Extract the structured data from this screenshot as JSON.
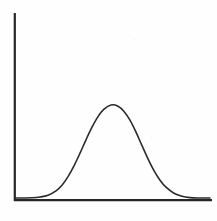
{
  "figure": {
    "title": "",
    "background_color": "#fefefe",
    "width": 217,
    "height": 221
  },
  "axes": {
    "line_color": "#262626",
    "x_axis": {
      "name": "horizontal-axis",
      "label": "",
      "x_start": 14,
      "x_end": 212,
      "y": 200,
      "thickness": 2
    },
    "y_axis": {
      "name": "vertical-axis",
      "label": "",
      "x": 14.5,
      "y_start": 13,
      "y_end": 201,
      "thickness": 2
    },
    "ticks": [],
    "tick_labels": [],
    "grid": false
  },
  "chart_data": {
    "type": "line",
    "title": "",
    "subtitle": "",
    "xlabel": "",
    "ylabel": "",
    "xlim": [
      0,
      217
    ],
    "ylim": [
      0,
      221
    ],
    "grid": false,
    "legend": [],
    "annotations": [],
    "curve": {
      "name": "bell-curve",
      "distribution": "gaussian",
      "stroke_color": "#2b2b2b",
      "stroke_width": 1.6,
      "baseline_y": 198,
      "peak_x": 111,
      "peak_y": 105,
      "amplitude": 93,
      "sigma": 25.5,
      "x_domain": [
        16,
        210
      ],
      "x": [
        16,
        24,
        32,
        40,
        48,
        56,
        62,
        68,
        74,
        80,
        86,
        92,
        98,
        104,
        111,
        118,
        124,
        130,
        136,
        142,
        148,
        154,
        160,
        166,
        174,
        182,
        190,
        198,
        210
      ],
      "y": [
        198,
        198,
        197.8,
        197,
        195.2,
        190.8,
        185.2,
        176.6,
        165.8,
        153.2,
        139.8,
        127.2,
        116.6,
        109.2,
        105,
        106.2,
        111.4,
        120.2,
        132.2,
        145.6,
        158.8,
        170.6,
        180.2,
        187.2,
        193.2,
        196.2,
        197.6,
        198,
        198
      ]
    }
  }
}
